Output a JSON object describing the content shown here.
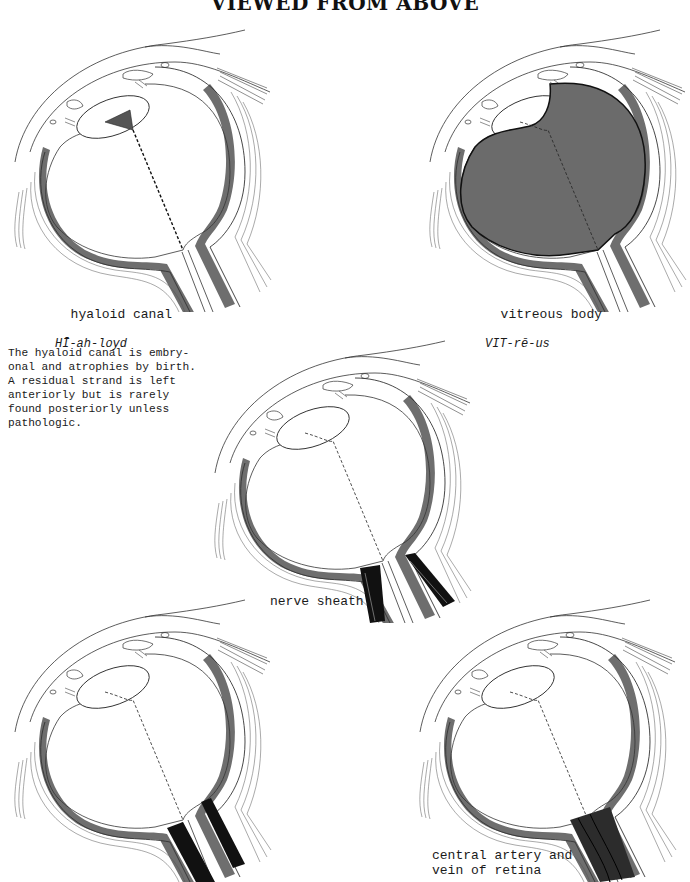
{
  "page": {
    "title": "VIEWED FROM ABOVE"
  },
  "diagrams": [
    {
      "id": "hyaloid-canal",
      "label": "hyaloid canal",
      "pronunciation": "HĪ-ah-loyd",
      "highlight": "hyaloid-canal"
    },
    {
      "id": "vitreous-body",
      "label": "vitreous body",
      "pronunciation": "VIT-rē-us",
      "highlight": "vitreous-body"
    },
    {
      "id": "nerve-sheath",
      "label": "nerve sheath",
      "pronunciation": "",
      "highlight": "nerve-sheath"
    },
    {
      "id": "unlabeled",
      "label": "",
      "pronunciation": "",
      "highlight": "dura-black"
    },
    {
      "id": "central-artery-vein",
      "label": "central artery and\nvein of retina",
      "pronunciation": "",
      "highlight": "central-vessels"
    }
  ],
  "note": {
    "text": "The hyaloid canal is embry-\nonal and atrophies by birth.\nA residual strand is left\nanteriorly but is rarely\nfound posteriorly unless\npathologic."
  },
  "colors": {
    "line": "#2a2a2a",
    "choroid_gray": "#6e6e6e",
    "vitreous_fill": "#6b6b6b",
    "black": "#111111",
    "paper": "#ffffff"
  }
}
